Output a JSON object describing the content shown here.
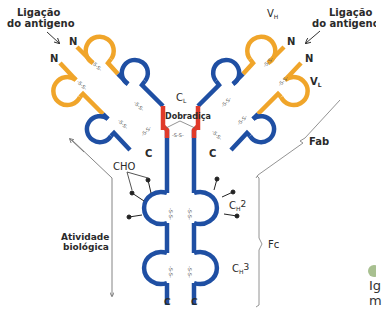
{
  "labels": {
    "antigen_left": [
      "Ligação",
      "do antigeno"
    ],
    "antigen_right": [
      "Ligação",
      "do antigeno"
    ],
    "vh": "V",
    "vh_sub": "H",
    "vl": "V",
    "vl_sub": "L",
    "cl": "C",
    "cl_sub": "L",
    "hinge": "Dobradiça",
    "fab": "Fab",
    "fc": "Fc",
    "cho": "CHO",
    "bio_activity": [
      "Atividade",
      "biológica"
    ],
    "ch2": "C",
    "ch2_sub": "H",
    "ch2_num": "2",
    "ch3": "C",
    "ch3_sub": "H",
    "ch3_num": "3",
    "n_terminus": "N",
    "c_terminus": "C",
    "disulfide": "-S-S-",
    "partial_text": [
      "Ig",
      "m"
    ]
  },
  "colors": {
    "variable": "#f0a52a",
    "constant": "#1f4fa3",
    "hinge": "#e03a2a",
    "brace": "#777777",
    "text": "#2a2a2a",
    "legend_dot": "#a8c090"
  }
}
